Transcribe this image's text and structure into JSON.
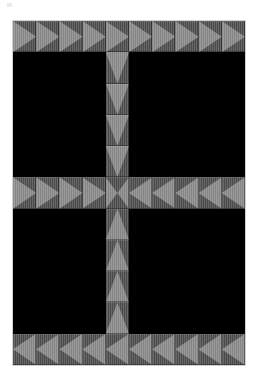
{
  "artwork": {
    "title": "Flying Geese Cross Quilt Block",
    "medium": "pieced striped cotton",
    "background_color": "#ffffff",
    "canvas": {
      "width": 258,
      "height": 375
    }
  },
  "palette": {
    "fabric_ground": "#5d5d5d",
    "triangle_light": "#949494",
    "void_black": "#000000",
    "page_white": "#ffffff"
  },
  "grid": {
    "columns": 10,
    "rows": 11,
    "left": 13,
    "top": 21,
    "width": 232,
    "height": 344,
    "tile_label": "quilt-block"
  },
  "legend": {
    "right": "right-pointing-triangle",
    "left": "left-pointing-triangle",
    "down": "down-pointing-triangle",
    "up": "up-pointing-triangle",
    "x": "double-triangle-x",
    "blank": "black-void"
  },
  "pattern": [
    [
      "right",
      "right",
      "right",
      "right",
      "right",
      "right",
      "right",
      "right",
      "right",
      "right"
    ],
    [
      "blank",
      "blank",
      "blank",
      "blank",
      "down",
      "blank",
      "blank",
      "blank",
      "blank",
      "blank"
    ],
    [
      "blank",
      "blank",
      "blank",
      "blank",
      "down",
      "blank",
      "blank",
      "blank",
      "blank",
      "blank"
    ],
    [
      "blank",
      "blank",
      "blank",
      "blank",
      "down",
      "blank",
      "blank",
      "blank",
      "blank",
      "blank"
    ],
    [
      "blank",
      "blank",
      "blank",
      "blank",
      "down",
      "blank",
      "blank",
      "blank",
      "blank",
      "blank"
    ],
    [
      "right",
      "right",
      "right",
      "right",
      "x",
      "left",
      "left",
      "left",
      "left",
      "left"
    ],
    [
      "blank",
      "blank",
      "blank",
      "blank",
      "up",
      "blank",
      "blank",
      "blank",
      "blank",
      "blank"
    ],
    [
      "blank",
      "blank",
      "blank",
      "blank",
      "up",
      "blank",
      "blank",
      "blank",
      "blank",
      "blank"
    ],
    [
      "blank",
      "blank",
      "blank",
      "blank",
      "up",
      "blank",
      "blank",
      "blank",
      "blank",
      "blank"
    ],
    [
      "blank",
      "blank",
      "blank",
      "blank",
      "up",
      "blank",
      "blank",
      "blank",
      "blank",
      "blank"
    ],
    [
      "left",
      "left",
      "left",
      "left",
      "left",
      "left",
      "left",
      "left",
      "left",
      "left"
    ]
  ]
}
